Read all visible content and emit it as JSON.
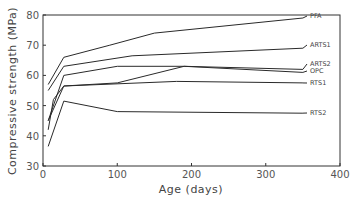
{
  "chart_data": {
    "type": "line",
    "title": "",
    "xlabel": "Age (days)",
    "ylabel": "Compressive strength (MPa)",
    "xlim": [
      0,
      400
    ],
    "ylim": [
      30,
      80
    ],
    "xticks": [
      0,
      100,
      200,
      300,
      400
    ],
    "yticks": [
      30,
      40,
      50,
      60,
      70,
      80
    ],
    "grid": false,
    "legend": "labels at right end of each line",
    "series": [
      {
        "name": "PFA",
        "x": [
          7,
          28,
          90,
          150,
          350
        ],
        "y": [
          57,
          66,
          70,
          74,
          79
        ]
      },
      {
        "name": "ARTS1",
        "x": [
          7,
          28,
          120,
          350
        ],
        "y": [
          55,
          63,
          66.5,
          69
        ]
      },
      {
        "name": "ARTS2",
        "x": [
          7,
          28,
          100,
          190,
          350
        ],
        "y": [
          45,
          60,
          63,
          63,
          62
        ]
      },
      {
        "name": "OPC",
        "x": [
          7,
          14,
          28,
          100,
          190,
          350
        ],
        "y": [
          42,
          52,
          56.5,
          57.5,
          63,
          61
        ]
      },
      {
        "name": "RTS1",
        "x": [
          7,
          28,
          180,
          350
        ],
        "y": [
          45,
          56.5,
          58,
          57.5
        ]
      },
      {
        "name": "RTS2",
        "x": [
          7,
          28,
          100,
          350
        ],
        "y": [
          36.5,
          51.5,
          48,
          47.5
        ]
      }
    ]
  },
  "labels": {
    "xlabel": "Age (days)",
    "ylabel": "Compressive strength (MPa)",
    "xticks": [
      "0",
      "100",
      "200",
      "300",
      "400"
    ],
    "yticks": [
      "30",
      "40",
      "50",
      "60",
      "70",
      "80"
    ],
    "series": [
      "PFA",
      "ARTS1",
      "ARTS2",
      "OPC",
      "RTS1",
      "RTS2"
    ]
  }
}
